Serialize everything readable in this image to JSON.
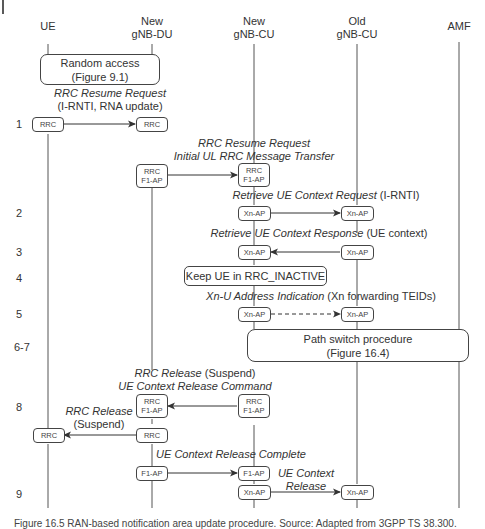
{
  "entities": [
    {
      "id": "ue",
      "label_line1": "",
      "label_line2": "UE"
    },
    {
      "id": "new-gnb-du",
      "label_line1": "New",
      "label_line2": "gNB-DU"
    },
    {
      "id": "new-gnb-cu",
      "label_line1": "New",
      "label_line2": "gNB-CU"
    },
    {
      "id": "old-gnb-cu",
      "label_line1": "Old",
      "label_line2": "gNB-CU"
    },
    {
      "id": "amf",
      "label_line1": "",
      "label_line2": "AMF"
    }
  ],
  "steps": [
    "1",
    "2",
    "3",
    "4",
    "5",
    "6-7",
    "8",
    "9"
  ],
  "procedures": {
    "random_access": {
      "line1": "Random access",
      "line2": "(Figure 9.1)"
    },
    "keep_ue": "Keep UE in RRC_INACTIVE",
    "path_switch": {
      "line1": "Path switch procedure",
      "line2": "(Figure 16.4)"
    }
  },
  "messages": {
    "m1": {
      "italic": "RRC Resume Request",
      "plain": "(I-RNTI, RNA update)"
    },
    "m1b": {
      "line1": "RRC Resume Request",
      "line2": "Initial UL RRC Message Transfer"
    },
    "m2": {
      "italic": "Retrieve UE Context Request",
      "plain": " (I-RNTI)"
    },
    "m3": {
      "italic": "Retrieve UE Context Response",
      "plain": " (UE context)"
    },
    "m5": {
      "italic": "Xn-U Address Indication",
      "plain": " (Xn forwarding TEIDs)"
    },
    "m8a": {
      "italic": "RRC Release",
      "plain": " (Suspend)",
      "line2": "UE Context Release Command"
    },
    "m8b": {
      "italic": "RRC Release",
      "plain": "(Suspend)"
    },
    "m9a": "UE Context Release Complete",
    "m9b": {
      "line1": "UE Context",
      "line2": "Release"
    }
  },
  "protocol_boxes": {
    "rrc": "RRC",
    "f1ap": "F1-AP",
    "xnap": "Xn-AP"
  },
  "caption": "Figure 16.5   RAN-based notification area update procedure. Source: Adapted from 3GPP TS 38.300."
}
